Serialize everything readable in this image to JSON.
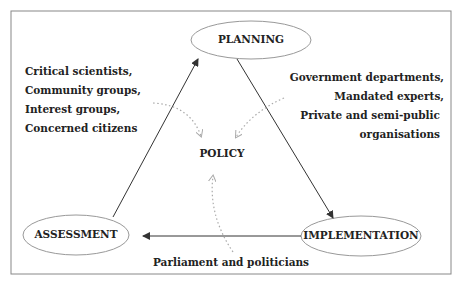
{
  "diagram": {
    "nodes": {
      "planning": "PLANNING",
      "implementation": "IMPLEMENTATION",
      "assessment": "ASSESSMENT",
      "policy": "POLICY"
    },
    "edges": [
      {
        "from": "planning",
        "to": "implementation"
      },
      {
        "from": "implementation",
        "to": "assessment"
      },
      {
        "from": "assessment",
        "to": "planning"
      }
    ],
    "actor_groups": {
      "left": [
        "Critical scientists,",
        "Community groups,",
        "Interest groups,",
        "Concerned citizens"
      ],
      "right": [
        "Government departments,",
        "Mandated experts,",
        "Private and semi-public",
        "organisations"
      ],
      "bottom": "Parliament and politicians"
    },
    "influence_arrows": [
      {
        "from": "left",
        "to": "policy",
        "style": "dotted"
      },
      {
        "from": "right",
        "to": "policy",
        "style": "dotted"
      },
      {
        "from": "bottom",
        "to": "policy",
        "style": "dotted"
      }
    ],
    "colors": {
      "line": "#333333",
      "ellipse_stroke": "#999999",
      "dotted": "#aaaaaa",
      "frame": "#888888"
    }
  }
}
